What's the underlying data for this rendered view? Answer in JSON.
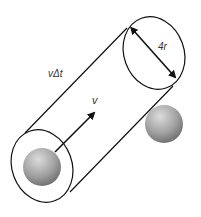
{
  "diagram": {
    "labels": {
      "diameter": "4r",
      "length": "vΔt",
      "velocity": "v"
    },
    "colors": {
      "stroke": "#111111",
      "text": "#333333",
      "sphere_light": "#d6d6d6",
      "sphere_dark": "#6e6e6e"
    },
    "elements": [
      {
        "type": "ellipse",
        "name": "front-end-ellipse",
        "cx": 42,
        "cy": 166
      },
      {
        "type": "ellipse",
        "name": "back-end-ellipse",
        "cx": 154,
        "cy": 53
      },
      {
        "type": "sphere",
        "name": "moving-molecule",
        "cx": 42,
        "cy": 167
      },
      {
        "type": "sphere",
        "name": "target-molecule",
        "cx": 164,
        "cy": 124
      }
    ]
  }
}
